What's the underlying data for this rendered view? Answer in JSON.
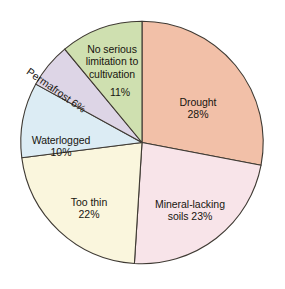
{
  "chart_data": {
    "type": "pie",
    "title": "",
    "subtitle": "",
    "xlabel": "",
    "ylabel": "",
    "units": "percent",
    "legend_position": "none",
    "grid": false,
    "start_angle_deg": 0,
    "direction": "clockwise",
    "categories": [
      "Drought",
      "Mineral-lacking soils",
      "Too thin",
      "Waterlogged",
      "Permafrost",
      "No serious limitation to cultivation"
    ],
    "values": [
      28,
      23,
      22,
      10,
      6,
      11
    ],
    "slices": [
      {
        "name": "drought",
        "label": "Drought",
        "value": 28,
        "value_text": "28%",
        "color": "#f2c0a8",
        "label_lines": "Drought"
      },
      {
        "name": "mineral-lacking-soils",
        "label": "Mineral-lacking soils",
        "value": 23,
        "value_text": "23%",
        "color": "#f8e4e9",
        "label_lines": "Mineral-lacking\nsoils 23%"
      },
      {
        "name": "too-thin",
        "label": "Too thin",
        "value": 22,
        "value_text": "22%",
        "color": "#faf6dd",
        "label_lines": "Too thin"
      },
      {
        "name": "waterlogged",
        "label": "Waterlogged",
        "value": 10,
        "value_text": "10%",
        "color": "#dcecf4",
        "label_lines": "Waterlogged"
      },
      {
        "name": "permafrost",
        "label": "Permafrost",
        "value": 6,
        "value_text": "6%",
        "color": "#ddd5e6",
        "label_lines": "Permafrost 6%"
      },
      {
        "name": "no-serious-limitation",
        "label": "No serious limitation to cultivation",
        "value": 11,
        "value_text": "11%",
        "color": "#cfe0b0",
        "label_lines": "No serious\nlimitation to\ncultivation"
      }
    ]
  },
  "labels": {
    "drought": {
      "text": "Drought",
      "pct": "28%"
    },
    "mineral": {
      "text": "Mineral-lacking",
      "pct": "soils 23%"
    },
    "too_thin": {
      "text": "Too thin",
      "pct": "22%"
    },
    "waterlogged": {
      "text": "Waterlogged",
      "pct": "10%"
    },
    "permafrost": {
      "text": "Permafrost 6%"
    },
    "no_serious": {
      "text": "No serious\nlimitation to\ncultivation",
      "pct": "11%"
    }
  },
  "colors": {
    "background": "#ffffff",
    "outline": "#3f3a33",
    "text": "#17150f",
    "drought": "#f2c0a8",
    "mineral_lacking_soils": "#f8e4e9",
    "too_thin": "#faf6dd",
    "waterlogged": "#dcecf4",
    "permafrost": "#ddd5e6",
    "no_serious_limitation": "#cfe0b0"
  }
}
